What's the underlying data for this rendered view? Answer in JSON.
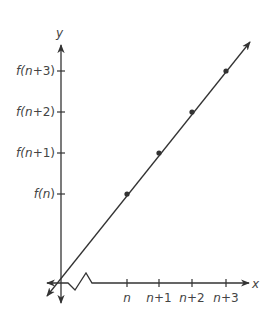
{
  "diagram": {
    "type": "linear function graph on coordinate axes",
    "axes": {
      "x_label": "x",
      "y_label": "y",
      "x_ticks": [
        {
          "var": "n",
          "rest": ""
        },
        {
          "var": "n",
          "rest": "+1"
        },
        {
          "var": "n",
          "rest": "+2"
        },
        {
          "var": "n",
          "rest": "+3"
        }
      ],
      "y_ticks": [
        {
          "pre": "f(",
          "var": "n",
          "rest": ")"
        },
        {
          "pre": "f(",
          "var": "n",
          "rest": "+1)"
        },
        {
          "pre": "f(",
          "var": "n",
          "rest": "+2)"
        },
        {
          "pre": "f(",
          "var": "n",
          "rest": "+3)"
        }
      ],
      "x_axis_break": true
    },
    "points": [
      {
        "label": "(n, f(n))"
      },
      {
        "label": "(n+1, f(n+1))"
      },
      {
        "label": "(n+2, f(n+2))"
      },
      {
        "label": "(n+3, f(n+3))"
      }
    ],
    "line_color": "#333333"
  }
}
